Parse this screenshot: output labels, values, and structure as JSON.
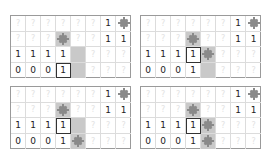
{
  "colors": {
    "shade": "#c9c9c9",
    "mine": "#8a8a8a",
    "border": "#9a9a9a",
    "unknown_glyph": "#e2e2e2"
  },
  "legend": {
    "unknown": "?",
    "mine_icon": "mine-icon"
  },
  "panels": [
    {
      "rows": [
        [
          {
            "t": "?"
          },
          {
            "t": "?"
          },
          {
            "t": "?"
          },
          {
            "t": "?"
          },
          {
            "t": "?"
          },
          {
            "t": "?"
          },
          {
            "t": "1"
          },
          {
            "t": "mine"
          }
        ],
        [
          {
            "t": "?"
          },
          {
            "t": "?"
          },
          {
            "t": "?"
          },
          {
            "t": "mine",
            "shade": true
          },
          {
            "t": "?"
          },
          {
            "t": "?"
          },
          {
            "t": "1"
          },
          {
            "t": "1"
          }
        ],
        [
          {
            "t": "1"
          },
          {
            "t": "1"
          },
          {
            "t": "1"
          },
          {
            "t": "1"
          },
          {
            "t": "",
            "shade": true
          },
          {
            "t": "?"
          },
          {
            "t": "?"
          },
          {
            "t": "?"
          }
        ],
        [
          {
            "t": "0"
          },
          {
            "t": "0"
          },
          {
            "t": "0"
          },
          {
            "t": "1",
            "sel": true
          },
          {
            "t": "",
            "shade": true
          },
          {
            "t": "?"
          },
          {
            "t": "?"
          },
          {
            "t": "?"
          }
        ]
      ]
    },
    {
      "rows": [
        [
          {
            "t": "?"
          },
          {
            "t": "?"
          },
          {
            "t": "?"
          },
          {
            "t": "?"
          },
          {
            "t": "?"
          },
          {
            "t": "?"
          },
          {
            "t": "1"
          },
          {
            "t": "mine"
          }
        ],
        [
          {
            "t": "?"
          },
          {
            "t": "?"
          },
          {
            "t": "?"
          },
          {
            "t": "mine",
            "shade": true
          },
          {
            "t": "?"
          },
          {
            "t": "?"
          },
          {
            "t": "1"
          },
          {
            "t": "1"
          }
        ],
        [
          {
            "t": "1"
          },
          {
            "t": "1"
          },
          {
            "t": "1"
          },
          {
            "t": "1",
            "sel": true
          },
          {
            "t": "mine",
            "shade": true
          },
          {
            "t": "?"
          },
          {
            "t": "?"
          },
          {
            "t": "?"
          }
        ],
        [
          {
            "t": "0"
          },
          {
            "t": "0"
          },
          {
            "t": "0"
          },
          {
            "t": "1"
          },
          {
            "t": "",
            "shade": true
          },
          {
            "t": "?"
          },
          {
            "t": "?"
          },
          {
            "t": "?"
          }
        ]
      ]
    },
    {
      "rows": [
        [
          {
            "t": "?"
          },
          {
            "t": "?"
          },
          {
            "t": "?"
          },
          {
            "t": "?"
          },
          {
            "t": "?"
          },
          {
            "t": "?"
          },
          {
            "t": "1"
          },
          {
            "t": "mine"
          }
        ],
        [
          {
            "t": "?"
          },
          {
            "t": "?"
          },
          {
            "t": "?"
          },
          {
            "t": "mine",
            "shade": true
          },
          {
            "t": "?"
          },
          {
            "t": "?"
          },
          {
            "t": "1"
          },
          {
            "t": "1"
          }
        ],
        [
          {
            "t": "1"
          },
          {
            "t": "1"
          },
          {
            "t": "1"
          },
          {
            "t": "1",
            "sel": true
          },
          {
            "t": "",
            "shade": true
          },
          {
            "t": "?"
          },
          {
            "t": "?"
          },
          {
            "t": "?"
          }
        ],
        [
          {
            "t": "0"
          },
          {
            "t": "0"
          },
          {
            "t": "0"
          },
          {
            "t": "1"
          },
          {
            "t": "mine",
            "shade": true
          },
          {
            "t": "?"
          },
          {
            "t": "?"
          },
          {
            "t": "?"
          }
        ]
      ]
    },
    {
      "rows": [
        [
          {
            "t": "?"
          },
          {
            "t": "?"
          },
          {
            "t": "?"
          },
          {
            "t": "?"
          },
          {
            "t": "?"
          },
          {
            "t": "?"
          },
          {
            "t": "1"
          },
          {
            "t": "mine"
          }
        ],
        [
          {
            "t": "?"
          },
          {
            "t": "?"
          },
          {
            "t": "?"
          },
          {
            "t": "mine",
            "shade": true
          },
          {
            "t": "?"
          },
          {
            "t": "?"
          },
          {
            "t": "1"
          },
          {
            "t": "1"
          }
        ],
        [
          {
            "t": "1"
          },
          {
            "t": "1"
          },
          {
            "t": "1"
          },
          {
            "t": "1",
            "sel": true
          },
          {
            "t": "mine",
            "shade": true
          },
          {
            "t": "?"
          },
          {
            "t": "?"
          },
          {
            "t": "?"
          }
        ],
        [
          {
            "t": "0"
          },
          {
            "t": "0"
          },
          {
            "t": "0"
          },
          {
            "t": "1"
          },
          {
            "t": "mine",
            "shade": true
          },
          {
            "t": "?"
          },
          {
            "t": "?"
          },
          {
            "t": "?"
          }
        ]
      ]
    }
  ]
}
